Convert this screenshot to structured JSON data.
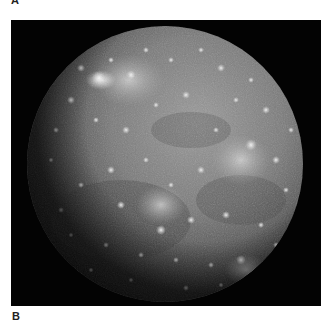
{
  "figure": {
    "panel_labels": {
      "top": "A",
      "bottom": "B"
    },
    "photo": {
      "subject": "cratered-moon",
      "background_color": "#030303",
      "moon": {
        "center_x": 154,
        "center_y": 144,
        "radius": 138,
        "base_color": "#6f6f6f",
        "highlight_color": "#d8d8d8",
        "shadow_color": "#1a1a1a"
      }
    }
  }
}
